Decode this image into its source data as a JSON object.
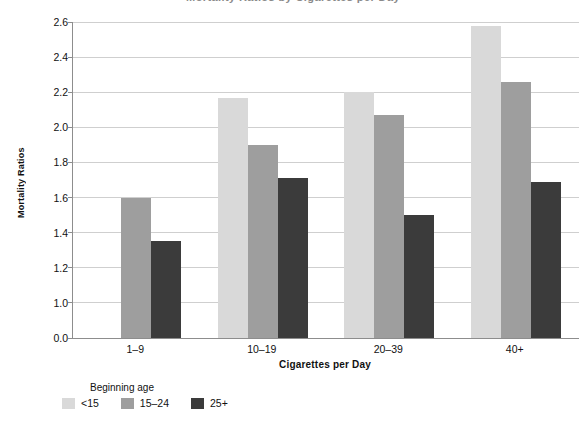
{
  "chart_data": {
    "type": "bar",
    "title": "Mortality Ratios by Cigarettes per Day",
    "xlabel": "Cigarettes per Day",
    "ylabel": "Mortality Ratios",
    "categories": [
      "1–9",
      "10–19",
      "20–39",
      "40+"
    ],
    "legend_title": "Beginning age",
    "legend_position": "bottom-left",
    "grid": true,
    "ylim": [
      0.9,
      2.6
    ],
    "yticks": [
      0.0,
      1.0,
      1.2,
      1.4,
      1.6,
      1.8,
      2.0,
      2.2,
      2.4,
      2.6
    ],
    "ytick_labels": [
      "0.0",
      "1.0",
      "1.2",
      "1.4",
      "1.6",
      "1.8",
      "2.0",
      "2.2",
      "2.4",
      "2.6"
    ],
    "axis_break": true,
    "series": [
      {
        "name": "<15",
        "color": "#d9d9d9",
        "values": [
          null,
          2.17,
          2.2,
          2.58
        ]
      },
      {
        "name": "15–24",
        "color": "#9e9e9e",
        "values": [
          1.6,
          1.9,
          2.07,
          2.26
        ]
      },
      {
        "name": "25+",
        "color": "#3b3b3b",
        "values": [
          1.35,
          1.71,
          1.5,
          1.69
        ]
      }
    ]
  }
}
